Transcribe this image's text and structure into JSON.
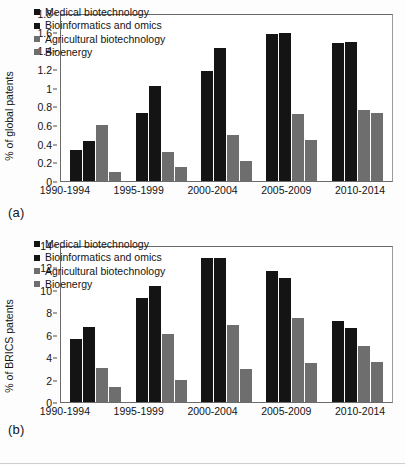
{
  "chart_data": [
    {
      "type": "bar",
      "panel": "(a)",
      "title": "",
      "xlabel": "",
      "ylabel": "% of global patents",
      "categories": [
        "1990-1994",
        "1995-1999",
        "2000-2004",
        "2005-2009",
        "2010-2014"
      ],
      "series": [
        {
          "name": "Medical biotechnology",
          "color": "#141414",
          "values": [
            0.34,
            0.74,
            1.19,
            1.59,
            1.5
          ]
        },
        {
          "name": "Bioinformatics and omics",
          "color": "#141414",
          "values": [
            0.43,
            1.03,
            1.44,
            1.61,
            1.51
          ]
        },
        {
          "name": "Agricultural biotechnology",
          "color": "#6e6e6e",
          "values": [
            0.61,
            0.32,
            0.5,
            0.73,
            0.77
          ]
        },
        {
          "name": "Bioenergy",
          "color": "#6e6e6e",
          "values": [
            0.1,
            0.15,
            0.22,
            0.45,
            0.74
          ]
        }
      ],
      "ylim": [
        0,
        1.8
      ],
      "yticks": [
        "1.8",
        "1.6",
        "1.4",
        "1.2",
        "1",
        "0.8",
        "0.6",
        "0.4",
        "0.2",
        "0"
      ],
      "ytick_values": [
        1.8,
        1.6,
        1.4,
        1.2,
        1.0,
        0.8,
        0.6,
        0.4,
        0.2,
        0
      ],
      "grid": false,
      "legend_position": "top-left"
    },
    {
      "type": "bar",
      "panel": "(b)",
      "title": "",
      "xlabel": "",
      "ylabel": "% of BRICS patents",
      "categories": [
        "1990-1994",
        "1995-1999",
        "2000-2004",
        "2005-2009",
        "2010-2014"
      ],
      "series": [
        {
          "name": "Medical biotechnology",
          "color": "#141414",
          "values": [
            5.7,
            9.4,
            13.0,
            11.8,
            7.3
          ]
        },
        {
          "name": "Bioinformatics and omics",
          "color": "#141414",
          "values": [
            6.8,
            10.5,
            13.0,
            11.2,
            6.7
          ]
        },
        {
          "name": "Agricultural biotechnology",
          "color": "#6e6e6e",
          "values": [
            3.05,
            6.1,
            7.0,
            7.55,
            5.1
          ]
        },
        {
          "name": "Bioenergy",
          "color": "#6e6e6e",
          "values": [
            1.4,
            2.0,
            2.95,
            3.55,
            3.6
          ]
        }
      ],
      "ylim": [
        0,
        14
      ],
      "yticks": [
        "14",
        "12",
        "10",
        "8",
        "6",
        "4",
        "2",
        "0"
      ],
      "ytick_values": [
        14,
        12,
        10,
        8,
        6,
        4,
        2,
        0
      ],
      "grid": false,
      "legend_position": "top-left"
    }
  ]
}
